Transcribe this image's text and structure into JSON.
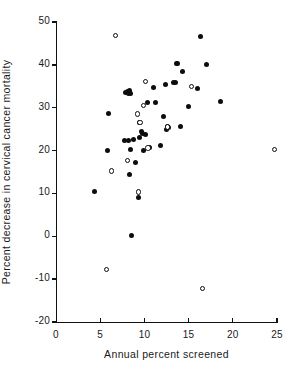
{
  "chart_data": {
    "type": "scatter",
    "title": "",
    "xlabel": "Annual percent screened",
    "ylabel": "Percent decrease in cervical cancer mortality",
    "xlim": [
      0,
      25
    ],
    "ylim": [
      -20,
      50
    ],
    "xticks": [
      0,
      5,
      10,
      15,
      20,
      25
    ],
    "yticks": [
      50,
      40,
      30,
      20,
      10,
      0,
      -10,
      -20
    ],
    "xtick_labels": [
      "0",
      "5",
      "10",
      "15",
      "20",
      "25"
    ],
    "ytick_labels": [
      "50",
      "40",
      "30",
      "20",
      "10",
      "0",
      "-10",
      "-20"
    ],
    "grid": false,
    "legend": null,
    "series": [
      {
        "name": "filled",
        "marker": "filled-circle",
        "color": "#0d0d0d",
        "points": [
          [
            4.4,
            10.5
          ],
          [
            5.8,
            20.0
          ],
          [
            5.9,
            28.6
          ],
          [
            7.7,
            22.3
          ],
          [
            7.9,
            33.5
          ],
          [
            8.1,
            33.8
          ],
          [
            8.2,
            33.4
          ],
          [
            8.3,
            34.0
          ],
          [
            8.4,
            33.4
          ],
          [
            8.2,
            22.4
          ],
          [
            8.3,
            14.4
          ],
          [
            8.4,
            20.2
          ],
          [
            8.5,
            0.1
          ],
          [
            8.8,
            22.7
          ],
          [
            9.0,
            17.2
          ],
          [
            9.3,
            9.0
          ],
          [
            9.4,
            23.0
          ],
          [
            9.5,
            26.5
          ],
          [
            9.7,
            24.4
          ],
          [
            9.8,
            24.1
          ],
          [
            9.9,
            20.0
          ],
          [
            10.1,
            23.8
          ],
          [
            10.4,
            31.2
          ],
          [
            10.6,
            20.7
          ],
          [
            11.0,
            34.8
          ],
          [
            11.2,
            31.3
          ],
          [
            11.8,
            21.1
          ],
          [
            12.2,
            27.9
          ],
          [
            12.5,
            25.0
          ],
          [
            12.6,
            25.6
          ],
          [
            12.7,
            25.3
          ],
          [
            12.4,
            35.4
          ],
          [
            13.3,
            36.0
          ],
          [
            13.5,
            35.9
          ],
          [
            13.6,
            40.4
          ],
          [
            13.8,
            40.3
          ],
          [
            14.1,
            25.6
          ],
          [
            14.3,
            38.5
          ],
          [
            15.0,
            30.4
          ],
          [
            16.0,
            34.6
          ],
          [
            16.3,
            46.6
          ],
          [
            17.0,
            40.1
          ],
          [
            18.6,
            31.5
          ]
        ]
      },
      {
        "name": "open",
        "marker": "open-circle",
        "color": "#0d0d0d",
        "points": [
          [
            5.7,
            -7.8
          ],
          [
            6.3,
            15.2
          ],
          [
            6.7,
            46.8
          ],
          [
            8.1,
            17.7
          ],
          [
            9.2,
            28.5
          ],
          [
            9.3,
            10.3
          ],
          [
            9.5,
            26.6
          ],
          [
            9.9,
            30.5
          ],
          [
            10.1,
            36.1
          ],
          [
            10.4,
            20.6
          ],
          [
            12.6,
            25.5
          ],
          [
            15.3,
            35.0
          ],
          [
            16.6,
            -12.2
          ],
          [
            24.7,
            20.2
          ]
        ]
      }
    ]
  },
  "axes": {
    "x_tick_labels": [
      "0",
      "5",
      "10",
      "15",
      "20",
      "25"
    ],
    "y_tick_labels": [
      "50",
      "40",
      "30",
      "20",
      "10",
      "0",
      "-10",
      "-20"
    ],
    "x_axis_label": "Annual percent screened",
    "y_axis_label": "Percent decrease in cervical cancer mortality"
  }
}
